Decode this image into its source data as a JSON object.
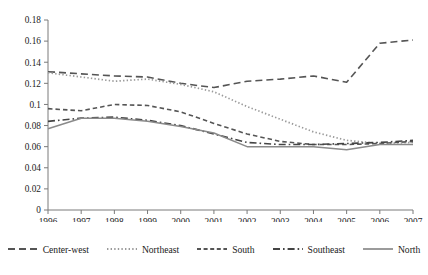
{
  "chart_data": {
    "type": "line",
    "title": "",
    "xlabel": "",
    "ylabel": "",
    "x": [
      1996,
      1997,
      1998,
      1999,
      2000,
      2001,
      2002,
      2003,
      2004,
      2005,
      2006,
      2007
    ],
    "xtick_labels": [
      "1996",
      "1997",
      "1998",
      "1999",
      "2000",
      "2001",
      "2002",
      "2003",
      "2004",
      "2005",
      "2006",
      "2007"
    ],
    "ytick_labels": [
      "0",
      "0.02",
      "0.04",
      "0.06",
      "0.08",
      "0.1",
      "0.12",
      "0.14",
      "0.16",
      "0.18"
    ],
    "ytick_values": [
      0,
      0.02,
      0.04,
      0.06,
      0.08,
      0.1,
      0.12,
      0.14,
      0.16,
      0.18
    ],
    "ylim": [
      0,
      0.18
    ],
    "xlim": [
      1996,
      2007
    ],
    "grid": false,
    "legend_position": "bottom",
    "series": [
      {
        "name": "Center-west",
        "style": "dashed",
        "color": "#555555",
        "values": [
          0.131,
          0.129,
          0.127,
          0.126,
          0.12,
          0.116,
          0.122,
          0.124,
          0.127,
          0.121,
          0.158,
          0.161
        ]
      },
      {
        "name": "Northeast",
        "style": "dotted",
        "color": "#9a9a9a",
        "values": [
          0.13,
          0.126,
          0.122,
          0.124,
          0.119,
          0.112,
          0.098,
          0.086,
          0.074,
          0.066,
          0.063,
          0.064
        ]
      },
      {
        "name": "South",
        "style": "short-dashed",
        "color": "#555555",
        "values": [
          0.096,
          0.094,
          0.1,
          0.099,
          0.093,
          0.082,
          0.072,
          0.065,
          0.062,
          0.062,
          0.063,
          0.065
        ]
      },
      {
        "name": "Southeast",
        "style": "dash-dot",
        "color": "#444444",
        "values": [
          0.084,
          0.087,
          0.088,
          0.085,
          0.08,
          0.072,
          0.064,
          0.062,
          0.062,
          0.063,
          0.064,
          0.066
        ]
      },
      {
        "name": "North",
        "style": "solid",
        "color": "#8a8a8a",
        "values": [
          0.077,
          0.087,
          0.087,
          0.084,
          0.079,
          0.073,
          0.06,
          0.06,
          0.06,
          0.057,
          0.062,
          0.062
        ]
      }
    ]
  },
  "legend": {
    "items": [
      {
        "label": "Center-west",
        "swatch": "dashed-swatch"
      },
      {
        "label": "Northeast",
        "swatch": "dotted-swatch"
      },
      {
        "label": "South",
        "swatch": "short-dashed-swatch"
      },
      {
        "label": "Southeast",
        "swatch": "dash-dot-swatch"
      },
      {
        "label": "North",
        "swatch": "solid-swatch"
      }
    ]
  },
  "caption": {
    "text": ""
  }
}
